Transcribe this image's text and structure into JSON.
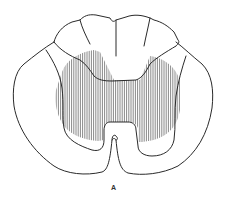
{
  "figure": {
    "label": "A",
    "colors": {
      "stroke": "#2a2a2a",
      "hatch": "#6a6a6a",
      "background": "#ffffff"
    }
  }
}
